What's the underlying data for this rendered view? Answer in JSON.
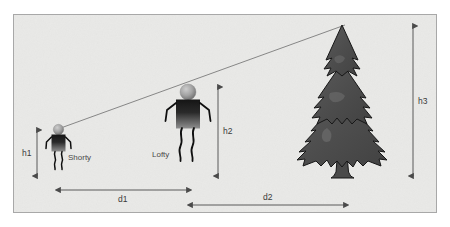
{
  "diagram": {
    "canvas": {
      "width": 450,
      "height": 227
    },
    "background": {
      "outer_color": "#ffffff",
      "panel_color": "#e9e9e7",
      "panel_border_color": "#a8a8a8"
    },
    "figures": [
      {
        "id": "shorty",
        "label": "Shorty",
        "role": "short-person",
        "head_color": "#9a9a9a",
        "body_color_top": "#1c1c1c",
        "body_color_bottom": "#8a8a8a"
      },
      {
        "id": "lofty",
        "label": "Lofty",
        "role": "tall-person",
        "head_color": "#9a9a9a",
        "body_color_top": "#1c1c1c",
        "body_color_bottom": "#8a8a8a"
      }
    ],
    "tree": {
      "id": "pine-tree",
      "kind": "conifer",
      "tiers": 3,
      "body_color": "#4f4f4f",
      "highlight_color": "#6e6e6e",
      "outline_color": "#171717"
    },
    "sight_line": {
      "id": "line-of-sight",
      "from": "shorty-eye",
      "to": "tree-top",
      "color": "#6d6d6d"
    },
    "measurements": [
      {
        "id": "h1",
        "label": "h1",
        "orientation": "vertical",
        "measures": "height of Shorty"
      },
      {
        "id": "h2",
        "label": "h2",
        "orientation": "vertical",
        "measures": "height of Lofty"
      },
      {
        "id": "h3",
        "label": "h3",
        "orientation": "vertical",
        "measures": "height of tree"
      },
      {
        "id": "d1",
        "label": "d1",
        "orientation": "horizontal",
        "measures": "distance from Shorty to Lofty"
      },
      {
        "id": "d2",
        "label": "d2",
        "orientation": "horizontal",
        "measures": "distance from Lofty to tree"
      }
    ],
    "arrow_color": "#4a4a4a"
  }
}
